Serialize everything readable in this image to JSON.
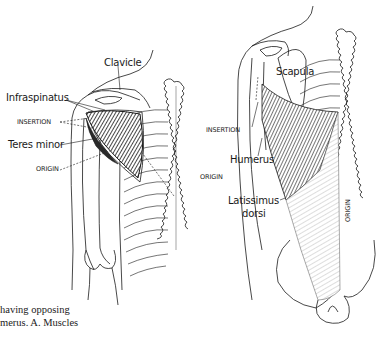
{
  "figure": {
    "panel_left": {
      "labels": {
        "clavicle": "Clavicle",
        "infraspinatus": "Infraspinatus",
        "insertion": "INSERTION",
        "teres_minor": "Teres minor",
        "origin_left": "ORIGIN",
        "origin_right": "ORIGIN"
      }
    },
    "panel_right": {
      "labels": {
        "scapula": "Scapula",
        "insertion": "INSERTION",
        "humerus": "Humerus",
        "latissimus_line1": "Latissimus",
        "latissimus_line2": "dorsi",
        "origin": "ORIGIN"
      }
    },
    "caption": {
      "line1": "having  opposing",
      "line2": "merus. A. Muscles"
    },
    "colors": {
      "ink": "#1a1a1a",
      "paper": "#ffffff"
    }
  }
}
